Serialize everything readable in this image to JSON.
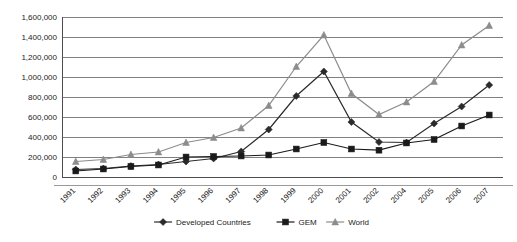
{
  "chart_data": {
    "type": "line",
    "title": "",
    "subtitle": "",
    "xlabel": "",
    "ylabel": "",
    "grid": true,
    "legend_position": "bottom",
    "categories": [
      "1991",
      "1992",
      "1993",
      "1994",
      "1995",
      "1996",
      "1997",
      "1998",
      "1999",
      "2000",
      "2001",
      "2002",
      "2004",
      "2005",
      "2006",
      "2007"
    ],
    "ylim": [
      0,
      1600000
    ],
    "ytick_labels": [
      "1,600,000",
      "1,400,000",
      "1,200,000",
      "1,000,000",
      "800,000",
      "600,000",
      "400,000",
      "200,000",
      "0"
    ],
    "ytick_values": [
      1600000,
      1400000,
      1200000,
      1000000,
      800000,
      600000,
      400000,
      200000,
      0
    ],
    "series": [
      {
        "name": "Developed Countries",
        "marker": "diamond",
        "color": "#2b2b2b",
        "values": [
          75000,
          85000,
          110000,
          125000,
          155000,
          185000,
          255000,
          475000,
          810000,
          1055000,
          550000,
          350000,
          345000,
          535000,
          705000,
          920000
        ]
      },
      {
        "name": "GEM",
        "marker": "square",
        "color": "#1a1a1a",
        "values": [
          60000,
          80000,
          105000,
          120000,
          200000,
          205000,
          210000,
          220000,
          280000,
          345000,
          280000,
          268000,
          340000,
          375000,
          510000,
          620000
        ]
      },
      {
        "name": "World",
        "marker": "triangle",
        "color": "#8c8c8c",
        "values": [
          155000,
          175000,
          225000,
          250000,
          345000,
          395000,
          490000,
          715000,
          1105000,
          1420000,
          835000,
          625000,
          750000,
          955000,
          1320000,
          1515000
        ]
      }
    ]
  },
  "legend": {
    "items": [
      {
        "label": "Developed Countries",
        "marker": "diamond",
        "color": "#2b2b2b"
      },
      {
        "label": "GEM",
        "marker": "square",
        "color": "#1a1a1a"
      },
      {
        "label": "World",
        "marker": "triangle",
        "color": "#8c8c8c"
      }
    ]
  }
}
